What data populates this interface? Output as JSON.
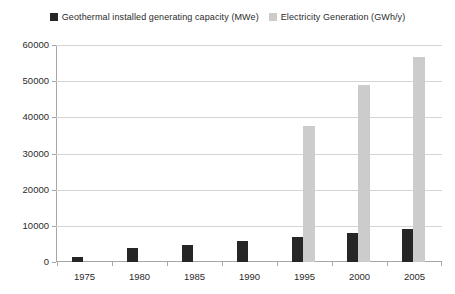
{
  "chart_data": {
    "type": "bar",
    "title": "",
    "xlabel": "",
    "ylabel": "",
    "categories": [
      "1975",
      "1980",
      "1985",
      "1990",
      "1995",
      "2000",
      "2005"
    ],
    "series": [
      {
        "name": "Geothermal installed generating capacity (MWe)",
        "color": "#262626",
        "values": [
          1300,
          3900,
          4800,
          5800,
          6800,
          8000,
          9000
        ]
      },
      {
        "name": "Electricity Generation (GWh/y)",
        "color": "#cccccc",
        "values": [
          0,
          0,
          0,
          0,
          37500,
          49000,
          56800
        ]
      }
    ],
    "ylim": [
      0,
      60000
    ],
    "yticks": [
      0,
      10000,
      20000,
      30000,
      40000,
      50000,
      60000
    ],
    "ytick_labels": [
      "0",
      "10000",
      "20000",
      "30000",
      "40000",
      "50000",
      "60000"
    ],
    "grid": true,
    "legend_position": "top-center"
  },
  "legend": {
    "entries": [
      {
        "label": "Geothermal installed generating capacity (MWe)",
        "swatch_name": "legend-swatch-geothermal-capacity"
      },
      {
        "label": "Electricity Generation (GWh/y)",
        "swatch_name": "legend-swatch-electricity-generation"
      }
    ]
  },
  "colors": {
    "series_dark": "#262626",
    "series_light": "#cccccc",
    "gridline": "#d4d4d4",
    "axis": "#a6a6a6",
    "text": "#2b2b2b",
    "background": "#ffffff"
  }
}
